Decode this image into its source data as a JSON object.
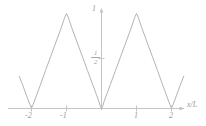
{
  "figure": {
    "background_color": "#ffffff",
    "line_color": "#b4b4b4",
    "axis_color": "#bdbdbd",
    "text_color": "#9a9a9a"
  },
  "axes": {
    "x_axis_label": "x/L",
    "y_axis_top_label": "1",
    "y_axis_half_numerator": "1",
    "y_axis_half_denominator": "2",
    "x_ticks": [
      {
        "label": "-2",
        "value": -2
      },
      {
        "label": "-1",
        "value": -1
      },
      {
        "label": "1",
        "value": 1
      },
      {
        "label": "2",
        "value": 2
      }
    ]
  },
  "chart_data": {
    "type": "line",
    "title": "",
    "subtitle": "",
    "xlabel": "x/L",
    "ylabel": "",
    "xlim": [
      -2.35,
      2.35
    ],
    "ylim": [
      0,
      1.05
    ],
    "grid": false,
    "legend": null,
    "axis_ticks": {
      "x": [
        -2,
        -1,
        1,
        2
      ],
      "y": [
        0.5,
        1
      ]
    },
    "series": [
      {
        "name": "triangle-wave",
        "comment": "periodic triangular wave, period 2 in x/L, minima at even integers, maxima value 1 at odd integers",
        "x": [
          -2.35,
          -2.25,
          -2.15,
          -2.05,
          -2.0,
          -1.95,
          -1.85,
          -1.75,
          -1.6,
          -1.45,
          -1.3,
          -1.15,
          -1.05,
          -1.0,
          -0.95,
          -0.85,
          -0.7,
          -0.55,
          -0.4,
          -0.25,
          -0.15,
          -0.07,
          -0.03,
          0.0,
          0.03,
          0.07,
          0.15,
          0.25,
          0.4,
          0.55,
          0.7,
          0.85,
          0.95,
          1.0,
          1.05,
          1.15,
          1.3,
          1.45,
          1.6,
          1.75,
          1.85,
          1.95,
          2.0,
          2.05,
          2.15,
          2.25,
          2.35
        ],
        "y": [
          0.34,
          0.245,
          0.145,
          0.045,
          0.005,
          0.045,
          0.145,
          0.245,
          0.4,
          0.55,
          0.7,
          0.85,
          0.96,
          1.0,
          0.96,
          0.85,
          0.7,
          0.55,
          0.4,
          0.25,
          0.15,
          0.07,
          0.02,
          0.0,
          0.02,
          0.07,
          0.15,
          0.25,
          0.4,
          0.55,
          0.7,
          0.85,
          0.96,
          1.0,
          0.96,
          0.85,
          0.7,
          0.55,
          0.4,
          0.245,
          0.145,
          0.045,
          0.005,
          0.045,
          0.145,
          0.245,
          0.34
        ]
      }
    ]
  }
}
